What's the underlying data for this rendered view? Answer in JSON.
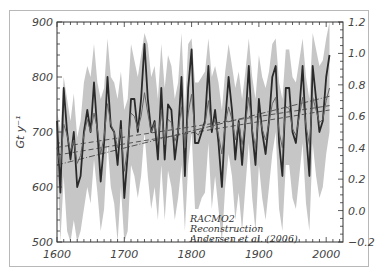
{
  "chart_data": {
    "type": "line",
    "title": "",
    "xlabel": "",
    "ylabel": "Gt y⁻¹",
    "ylabel_right": "",
    "xlim": [
      1600,
      2025
    ],
    "ylim": [
      500,
      900
    ],
    "ylim_right": [
      -0.2,
      1.2
    ],
    "x_ticks": [
      1600,
      1700,
      1800,
      1900,
      2000
    ],
    "y_ticks": [
      500,
      600,
      700,
      800,
      900
    ],
    "y_ticks_right": [
      -0.2,
      0.0,
      0.2,
      0.4,
      0.6,
      0.8,
      1.0,
      1.2
    ],
    "grid": false,
    "legend": {
      "position": "lower-center-right",
      "entries": [
        "RACMO2",
        "Reconstruction",
        "Andersen et al. (2006)"
      ]
    },
    "x": [
      1600,
      1605,
      1610,
      1615,
      1620,
      1625,
      1630,
      1635,
      1640,
      1645,
      1650,
      1655,
      1660,
      1665,
      1670,
      1675,
      1680,
      1685,
      1690,
      1695,
      1700,
      1705,
      1710,
      1715,
      1720,
      1725,
      1730,
      1735,
      1740,
      1745,
      1750,
      1755,
      1760,
      1765,
      1770,
      1775,
      1780,
      1785,
      1790,
      1795,
      1800,
      1805,
      1810,
      1815,
      1820,
      1825,
      1830,
      1835,
      1840,
      1845,
      1850,
      1855,
      1860,
      1865,
      1870,
      1875,
      1880,
      1885,
      1890,
      1895,
      1900,
      1905,
      1910,
      1915,
      1920,
      1925,
      1930,
      1935,
      1940,
      1945,
      1950,
      1955,
      1960,
      1965,
      1970,
      1975,
      1980,
      1985,
      1990,
      1995,
      2000,
      2005
    ],
    "series": [
      {
        "name": "Reconstruction (RACMO2)",
        "axis": "left",
        "color": "#2a2a2a",
        "values": [
          720,
          590,
          780,
          700,
          650,
          700,
          600,
          620,
          700,
          740,
          700,
          790,
          700,
          610,
          680,
          800,
          710,
          700,
          640,
          720,
          580,
          660,
          760,
          760,
          700,
          760,
          860,
          760,
          700,
          720,
          650,
          780,
          650,
          750,
          740,
          650,
          700,
          800,
          620,
          780,
          850,
          680,
          680,
          700,
          720,
          820,
          700,
          740,
          680,
          600,
          720,
          800,
          740,
          650,
          720,
          640,
          720,
          820,
          700,
          640,
          760,
          700,
          660,
          720,
          800,
          820,
          680,
          620,
          780,
          780,
          700,
          680,
          740,
          820,
          700,
          620,
          820,
          760,
          700,
          720,
          800,
          840
        ]
      },
      {
        "name": "Andersen et al. (2006)",
        "axis": "right",
        "color": "#666666",
        "values": [
          0.4,
          0.28,
          0.55,
          0.48,
          0.38,
          0.45,
          0.3,
          0.35,
          0.48,
          0.58,
          0.5,
          0.62,
          0.52,
          0.36,
          0.47,
          0.68,
          0.55,
          0.5,
          0.4,
          0.52,
          0.25,
          0.4,
          0.62,
          0.6,
          0.52,
          0.6,
          0.75,
          0.62,
          0.5,
          0.56,
          0.44,
          0.64,
          0.42,
          0.58,
          0.56,
          0.44,
          0.5,
          0.66,
          0.4,
          0.62,
          0.74,
          0.5,
          0.48,
          0.52,
          0.55,
          0.7,
          0.52,
          0.58,
          0.48,
          0.36,
          0.55,
          0.66,
          0.58,
          0.45,
          0.56,
          0.42,
          0.55,
          0.72,
          0.52,
          0.4,
          0.62,
          0.52,
          0.45,
          0.56,
          0.68,
          0.72,
          0.5,
          0.4,
          0.66,
          0.65,
          0.52,
          0.48,
          0.6,
          0.72,
          0.54,
          0.42,
          0.72,
          0.64,
          0.56,
          0.58,
          0.7,
          0.78
        ]
      },
      {
        "name": "Uncertainty band upper",
        "axis": "left",
        "color": "#c8c8c8",
        "values": [
          740,
          700,
          800,
          760,
          720,
          770,
          690,
          720,
          790,
          820,
          800,
          860,
          790,
          760,
          780,
          870,
          800,
          790,
          760,
          810,
          740,
          760,
          860,
          830,
          800,
          840,
          880,
          860,
          800,
          820,
          760,
          860,
          780,
          840,
          820,
          760,
          790,
          880,
          740,
          860,
          870,
          790,
          790,
          800,
          810,
          870,
          800,
          820,
          790,
          740,
          810,
          860,
          820,
          780,
          810,
          760,
          810,
          870,
          800,
          760,
          840,
          800,
          780,
          810,
          860,
          870,
          790,
          760,
          850,
          850,
          800,
          790,
          830,
          870,
          800,
          760,
          880,
          850,
          820,
          830,
          870,
          900
        ]
      },
      {
        "name": "Uncertainty band lower",
        "axis": "left",
        "color": "#c8c8c8",
        "values": [
          660,
          500,
          620,
          520,
          500,
          540,
          500,
          520,
          560,
          600,
          570,
          650,
          590,
          520,
          560,
          680,
          600,
          570,
          500,
          600,
          500,
          520,
          640,
          620,
          580,
          620,
          700,
          620,
          560,
          600,
          540,
          640,
          540,
          630,
          600,
          540,
          580,
          640,
          520,
          640,
          700,
          560,
          560,
          580,
          590,
          680,
          560,
          620,
          560,
          500,
          600,
          660,
          620,
          540,
          590,
          520,
          600,
          680,
          580,
          520,
          640,
          580,
          540,
          600,
          660,
          700,
          560,
          520,
          640,
          640,
          580,
          560,
          620,
          680,
          570,
          520,
          680,
          620,
          580,
          600,
          660,
          700
        ]
      }
    ],
    "trend_lines": [
      {
        "name": "Reconstruction trend",
        "style": "dashed",
        "x": [
          1600,
          2005
        ],
        "y_left": [
          672,
          748
        ]
      },
      {
        "name": "Andersen trend",
        "style": "dash-dot",
        "x": [
          1600,
          2005
        ],
        "y_left": [
          640,
          765
        ]
      },
      {
        "name": "Linear fit",
        "style": "dashed",
        "x": [
          1600,
          2005
        ],
        "y_left": [
          658,
          740
        ]
      }
    ],
    "annotations": [
      "RACMO2",
      "Reconstruction",
      "Andersen et al. (2006)"
    ]
  }
}
